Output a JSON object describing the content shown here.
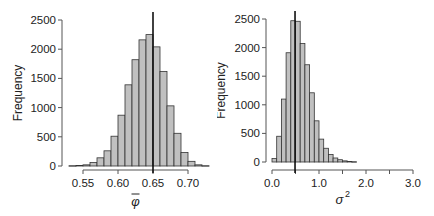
{
  "chart_data": [
    {
      "type": "bar",
      "title": "",
      "xlabel": "φ̄ (phi bar)",
      "xlabel_symbol": "φ",
      "ylabel": "Frequency",
      "bin_width": 0.01,
      "x": [
        0.53,
        0.54,
        0.55,
        0.56,
        0.57,
        0.58,
        0.59,
        0.6,
        0.61,
        0.62,
        0.63,
        0.64,
        0.65,
        0.66,
        0.67,
        0.68,
        0.69,
        0.7,
        0.71,
        0.72
      ],
      "values": [
        5,
        10,
        20,
        60,
        140,
        260,
        510,
        870,
        1390,
        1820,
        2160,
        2250,
        2040,
        1620,
        1030,
        560,
        230,
        80,
        20,
        5
      ],
      "xlim": [
        0.53,
        0.73
      ],
      "ylim": [
        0,
        2500
      ],
      "xticks": [
        "0.55",
        "0.60",
        "0.65",
        "0.70"
      ],
      "xtick_values": [
        0.55,
        0.6,
        0.65,
        0.7
      ],
      "yticks": [
        "0",
        "500",
        "1000",
        "1500",
        "2000",
        "2500"
      ],
      "ytick_values": [
        0,
        500,
        1000,
        1500,
        2000,
        2500
      ],
      "vline": 0.65,
      "bar_color": "#c0c0c0",
      "edge_color": "#333333",
      "grid": false
    },
    {
      "type": "bar",
      "title": "",
      "xlabel": "σ²",
      "xlabel_symbol": "σ",
      "xlabel_sup": "2",
      "ylabel": "Frequency",
      "bin_width": 0.1,
      "x": [
        0.0,
        0.1,
        0.2,
        0.3,
        0.4,
        0.5,
        0.6,
        0.7,
        0.8,
        0.9,
        1.0,
        1.1,
        1.2,
        1.3,
        1.4,
        1.5,
        1.6,
        1.7
      ],
      "values": [
        60,
        450,
        1100,
        1910,
        2470,
        2460,
        2070,
        1700,
        1210,
        720,
        400,
        240,
        130,
        70,
        40,
        20,
        10,
        5
      ],
      "xlim": [
        0.0,
        3.0
      ],
      "ylim": [
        0,
        2500
      ],
      "xticks": [
        "0.0",
        "1.0",
        "2.0",
        "3.0"
      ],
      "xtick_values": [
        0.0,
        1.0,
        2.0,
        3.0
      ],
      "minor_xtick_values": [
        0.5,
        1.5,
        2.5
      ],
      "yticks": [
        "0",
        "500",
        "1000",
        "1500",
        "2000",
        "2500"
      ],
      "ytick_values": [
        0,
        500,
        1000,
        1500,
        2000,
        2500
      ],
      "vline": 0.49,
      "bar_color": "#c0c0c0",
      "edge_color": "#333333",
      "grid": false
    }
  ]
}
